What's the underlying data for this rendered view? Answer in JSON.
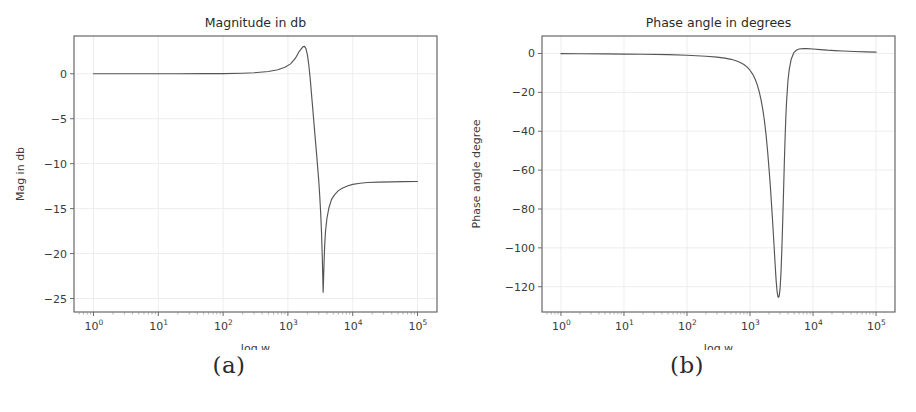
{
  "figure": {
    "caption_a": "(a)",
    "caption_b": "(b)"
  },
  "chart_data": [
    {
      "panel": "a",
      "type": "line",
      "title": "Magnitude in db",
      "xlabel": "log w",
      "ylabel": "Mag in db",
      "xscale": "log",
      "xlim": [
        0.5,
        200000
      ],
      "ylim": [
        -26.5,
        4.2
      ],
      "grid": true,
      "legend": null,
      "xticks": [
        1,
        10,
        100,
        1000,
        10000,
        100000
      ],
      "xticklabels": [
        "10^0",
        "10^1",
        "10^2",
        "10^3",
        "10^4",
        "10^5"
      ],
      "xtick_bases": [
        "10",
        "10",
        "10",
        "10",
        "10",
        "10"
      ],
      "xtick_exponents": [
        "0",
        "1",
        "2",
        "3",
        "4",
        "5"
      ],
      "yticks": [
        0,
        -5,
        -10,
        -15,
        -20,
        -25
      ],
      "yticklabels": [
        "0",
        "−5",
        "−10",
        "−15",
        "−20",
        "−25"
      ],
      "series": [
        {
          "name": "magnitude",
          "color": "#555555",
          "x": [
            1,
            2,
            5,
            10,
            20,
            50,
            100,
            200,
            300,
            500,
            700,
            900,
            1100,
            1300,
            1500,
            1700,
            1800,
            1900,
            2000,
            2100,
            2200,
            2400,
            2600,
            2800,
            3000,
            3100,
            3200,
            3300,
            3400,
            3450,
            3500,
            3550,
            3600,
            3700,
            3800,
            4000,
            4300,
            4700,
            5200,
            6000,
            7000,
            8500,
            10000,
            13000,
            17000,
            25000,
            40000,
            60000,
            100000
          ],
          "y": [
            0.0,
            0.0,
            0.0,
            0.0,
            0.0,
            0.01,
            0.02,
            0.06,
            0.11,
            0.25,
            0.45,
            0.72,
            1.1,
            1.7,
            2.5,
            3.0,
            3.05,
            2.8,
            2.1,
            1.0,
            -0.4,
            -3.6,
            -6.6,
            -9.3,
            -12.0,
            -13.6,
            -15.4,
            -17.6,
            -20.6,
            -22.5,
            -24.3,
            -23.0,
            -21.3,
            -19.0,
            -17.6,
            -16.1,
            -14.9,
            -14.0,
            -13.5,
            -13.0,
            -12.7,
            -12.45,
            -12.3,
            -12.18,
            -12.1,
            -12.05,
            -12.02,
            -12.0,
            -11.98
          ]
        }
      ],
      "annotations": {
        "peak_db": 3.05,
        "peak_w": 1800,
        "notch_db": -24.3,
        "notch_w": 3500,
        "hf_asymptote_db": -12.0
      }
    },
    {
      "panel": "b",
      "type": "line",
      "title": "Phase angle in degrees",
      "xlabel": "log w",
      "ylabel": "Phase angle degree",
      "xscale": "log",
      "xlim": [
        0.5,
        200000
      ],
      "ylim": [
        -133,
        9
      ],
      "grid": true,
      "legend": null,
      "xticks": [
        1,
        10,
        100,
        1000,
        10000,
        100000
      ],
      "xticklabels": [
        "10^0",
        "10^1",
        "10^2",
        "10^3",
        "10^4",
        "10^5"
      ],
      "xtick_bases": [
        "10",
        "10",
        "10",
        "10",
        "10",
        "10"
      ],
      "xtick_exponents": [
        "0",
        "1",
        "2",
        "3",
        "4",
        "5"
      ],
      "yticks": [
        0,
        -20,
        -40,
        -60,
        -80,
        -100,
        -120
      ],
      "yticklabels": [
        "0",
        "−20",
        "−40",
        "−60",
        "−80",
        "−100",
        "−120"
      ],
      "series": [
        {
          "name": "phase",
          "color": "#555555",
          "x": [
            1,
            2,
            5,
            10,
            20,
            50,
            100,
            200,
            300,
            400,
            500,
            600,
            700,
            800,
            900,
            1000,
            1100,
            1200,
            1300,
            1400,
            1500,
            1600,
            1700,
            1800,
            1900,
            2000,
            2100,
            2200,
            2300,
            2400,
            2500,
            2600,
            2700,
            2800,
            2900,
            3000,
            3100,
            3200,
            3300,
            3400,
            3500,
            3600,
            3700,
            3800,
            4000,
            4200,
            4500,
            5000,
            5500,
            6000,
            7000,
            8000,
            10000,
            13000,
            17000,
            22000,
            30000,
            45000,
            70000,
            100000
          ],
          "y": [
            -0.1,
            -0.15,
            -0.2,
            -0.3,
            -0.4,
            -0.6,
            -0.9,
            -1.4,
            -1.9,
            -2.4,
            -3.0,
            -3.7,
            -4.6,
            -5.7,
            -7.0,
            -8.6,
            -10.6,
            -13.0,
            -16.0,
            -19.6,
            -24.0,
            -29.0,
            -35.0,
            -42.0,
            -50.0,
            -59.0,
            -68.0,
            -78.0,
            -88.0,
            -98.0,
            -108.0,
            -117.0,
            -123.0,
            -125.5,
            -125.0,
            -121.0,
            -113.0,
            -101.0,
            -87.0,
            -72.0,
            -57.0,
            -44.0,
            -33.0,
            -25.0,
            -14.0,
            -8.0,
            -3.0,
            0.6,
            1.8,
            2.3,
            2.5,
            2.5,
            2.3,
            2.0,
            1.7,
            1.5,
            1.3,
            1.0,
            0.8,
            0.7
          ]
        }
      ],
      "annotations": {
        "min_deg": -125.5,
        "min_w": 2800,
        "overshoot_deg": 2.5,
        "overshoot_w": 7500
      }
    }
  ]
}
